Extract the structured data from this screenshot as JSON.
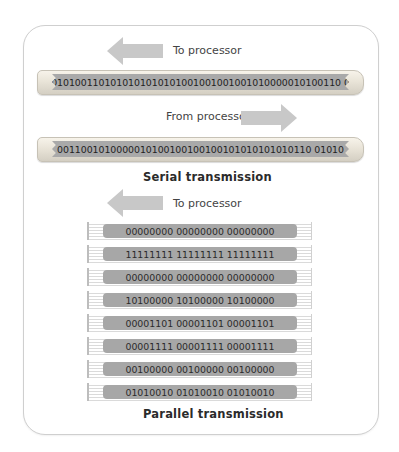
{
  "figure": {
    "serial": {
      "to_processor_label": "To processor",
      "from_processor_label": "From processor",
      "bus_1_bits": "0101001101010101010101001001001001010000010100110 0",
      "bus_2_bits": "0011001010000010100100100100101010101010110 01010",
      "caption": "Serial transmission"
    },
    "parallel": {
      "to_processor_label": "To processor",
      "wires": [
        "00000000 00000000 00000000",
        "11111111 11111111 11111111",
        "00000000 00000000 00000000",
        "10100000 10100000 10100000",
        "00001101 00001101 00001101",
        "00001111 00001111 00001111",
        "00100000 00100000 00100000",
        "01010010 01010010 01010010"
      ],
      "caption": "Parallel transmission"
    },
    "icons": {
      "left_arrow": "arrow-left-icon",
      "right_arrow": "arrow-right-icon"
    },
    "colors": {
      "arrow": "#c8c8c8",
      "band": "#a9a9a9",
      "tube": "#ece7dc",
      "frame_border": "#cfcfcf"
    }
  }
}
